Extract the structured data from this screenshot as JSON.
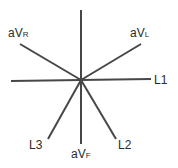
{
  "diagram": {
    "type": "hexaxial-reference-system",
    "center": [
      81,
      80
    ],
    "line_color": "#474747",
    "label_color": "#2a2a2a",
    "axes": [
      {
        "id": "vertical",
        "x1": 81,
        "y1": 10,
        "x2": 81,
        "y2": 144
      },
      {
        "id": "L1",
        "x1": 11,
        "y1": 81,
        "x2": 151,
        "y2": 79
      },
      {
        "id": "aVR",
        "x1": 20,
        "y1": 44,
        "x2": 81,
        "y2": 80
      },
      {
        "id": "aVL",
        "x1": 81,
        "y1": 80,
        "x2": 141,
        "y2": 44
      },
      {
        "id": "L3",
        "x1": 81,
        "y1": 80,
        "x2": 48,
        "y2": 139
      },
      {
        "id": "L2",
        "x1": 81,
        "y1": 80,
        "x2": 116,
        "y2": 139
      }
    ],
    "labels": {
      "aVR": {
        "main": "aV",
        "sub": "R"
      },
      "aVL": {
        "main": "aV",
        "sub": "L"
      },
      "L1": {
        "main": "L1"
      },
      "L3": {
        "main": "L3"
      },
      "aVF": {
        "main": "aV",
        "sub": "F"
      },
      "L2": {
        "main": "L2"
      }
    }
  }
}
